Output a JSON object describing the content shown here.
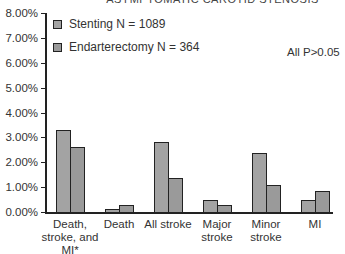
{
  "chart_data": {
    "type": "bar",
    "title": "ASYMPTOMATIC CAROTID STENOSIS",
    "xlabel": "",
    "ylabel": "",
    "ylim": [
      0,
      8
    ],
    "yticks": [
      "0.00%",
      "1.00%",
      "2.00%",
      "3.00%",
      "4.00%",
      "5.00%",
      "6.00%",
      "7.00%",
      "8.00%"
    ],
    "categories": [
      "Death,\nstroke, and\nMI*",
      "Death",
      "All stroke",
      "Major\nstroke",
      "Minor\nstroke",
      "MI"
    ],
    "series": [
      {
        "name": "Stenting N = 1089",
        "color": "#a3a3a3",
        "values": [
          3.3,
          0.12,
          2.8,
          0.48,
          2.37,
          0.48
        ]
      },
      {
        "name": "Endarterectomy N = 364",
        "color": "#9a9a9a",
        "values": [
          2.6,
          0.3,
          1.37,
          0.28,
          1.1,
          0.85
        ]
      }
    ],
    "annotations": [
      "All P>0.05"
    ],
    "legend_position": "upper-left",
    "grid": false
  }
}
